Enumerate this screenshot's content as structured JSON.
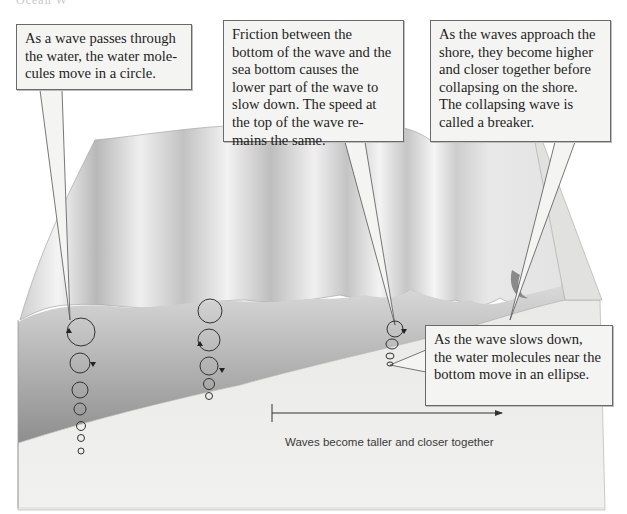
{
  "header": {
    "cropped_title": "Ocean W"
  },
  "callouts": [
    {
      "id": "water-circle",
      "text": "As a wave passes through the water, the water mole-cules move in a circle."
    },
    {
      "id": "friction",
      "text": "Friction between the bottom of the wave and the sea bottom causes the lower part of the wave to slow down. The speed at the top of the wave re-mains the same."
    },
    {
      "id": "breaker",
      "text": "As the waves approach the shore, they become higher and closer together before collapsing on the shore. The collapsing wave is called a breaker."
    },
    {
      "id": "ellipse",
      "text": "As the wave slows down, the water molecules near the bottom move in an ellipse."
    }
  ],
  "arrow": {
    "caption": "Waves become taller and closer together",
    "direction": "right"
  },
  "colors": {
    "water_side": "#9a9a9a",
    "sea_bottom": "#e6e6e4",
    "wave_surface": "#d8d8d8",
    "callout_bg": "#f4f4f2",
    "callout_border": "#6a6a6a"
  },
  "orbit_columns": [
    {
      "name": "deep-water-column-1",
      "circles": 7,
      "shape": "circle"
    },
    {
      "name": "deep-water-column-2",
      "circles": 5,
      "shape": "circle"
    },
    {
      "name": "shallow-water-column",
      "circles": 4,
      "shape": "ellipse"
    }
  ]
}
